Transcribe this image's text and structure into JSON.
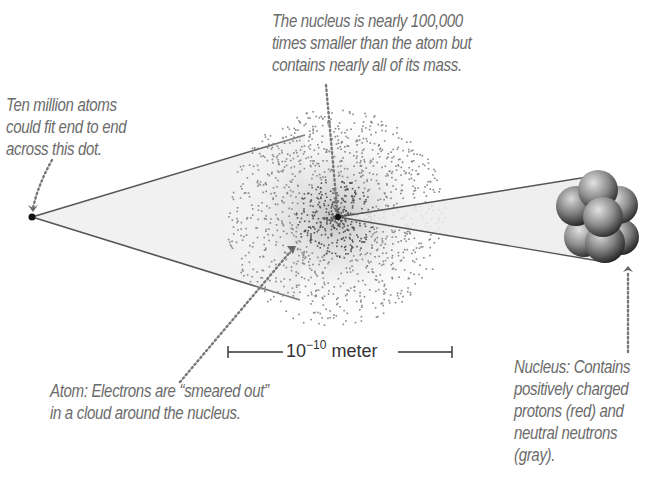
{
  "diagram": {
    "captions": {
      "dot": [
        "Ten million atoms",
        "could fit end to end",
        "across this dot."
      ],
      "nucleus_scale": [
        "The nucleus is nearly 100,000",
        "times smaller than the atom but",
        "contains nearly all of its mass."
      ],
      "atom": [
        "Atom: Electrons are “smeared out”",
        "in a cloud around the nucleus."
      ],
      "nucleus": [
        "Nucleus: Contains",
        "positively charged",
        "protons (red) and",
        "neutral neutrons",
        "(gray)."
      ]
    },
    "scale_bar": {
      "base": "10",
      "exponent": "−10",
      "unit": "meter"
    },
    "elements": [
      "dot",
      "electron-cloud",
      "nucleus-point",
      "nucleus-cluster"
    ],
    "colors": {
      "caption": "#6b6b6b",
      "line": "#555555",
      "proton": "#b0443c",
      "neutron": "#8a8a8a"
    }
  }
}
